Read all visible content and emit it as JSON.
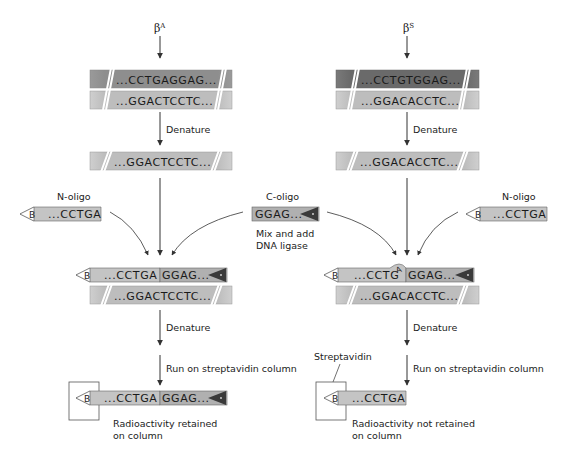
{
  "left": {
    "allele_label": "βA",
    "allele_base": "β",
    "allele_sup": "A",
    "duplex_top": "...CCTGAGGAG...",
    "duplex_bottom": "...GGACTCCTC...",
    "step_denature_1": "Denature",
    "single_strand": "...GGACTCCTC...",
    "n_oligo_label": "N-oligo",
    "n_oligo_seq": "...CCTGA",
    "ligated_n": "...CCTGA",
    "ligated_c": "GGAG...",
    "ligated_template": "...GGACTCCTC...",
    "step_denature_2": "Denature",
    "step_column": "Run on streptavidin column",
    "result_n": "...CCTGA",
    "result_c": "GGAG...",
    "result_text_1": "Radioactivity retained",
    "result_text_2": "on column"
  },
  "right": {
    "allele_label": "βS",
    "allele_base": "β",
    "allele_sup": "S",
    "duplex_top": "...CCTGTGGAG...",
    "duplex_bottom": "...GGACACCTC...",
    "step_denature_1": "Denature",
    "single_strand": "...GGACACCTC...",
    "n_oligo_label": "N-oligo",
    "n_oligo_seq": "...CCTGA",
    "ligated_n": "...CCTG",
    "mismatch_base": "A",
    "ligated_c": "GGAG...",
    "ligated_template": "...GGACACCTC...",
    "step_denature_2": "Denature",
    "step_column": "Run on streptavidin column",
    "streptavidin_label": "Streptavidin",
    "result_n": "...CCTGA",
    "result_text_1": "Radioactivity not retained",
    "result_text_2": "on column"
  },
  "center": {
    "c_oligo_label": "C-oligo",
    "c_oligo_seq": "GGAG...",
    "mix_text_1": "Mix and add",
    "mix_text_2": "DNA ligase"
  },
  "glyphs": {
    "biotin": "B"
  },
  "colors": {
    "light_strand": "#bdbdbd",
    "dark_strand": "#8a8a8a",
    "darker_strand": "#6e6e6e",
    "label_triangle": "#3a3a3a",
    "line": "#333333"
  }
}
